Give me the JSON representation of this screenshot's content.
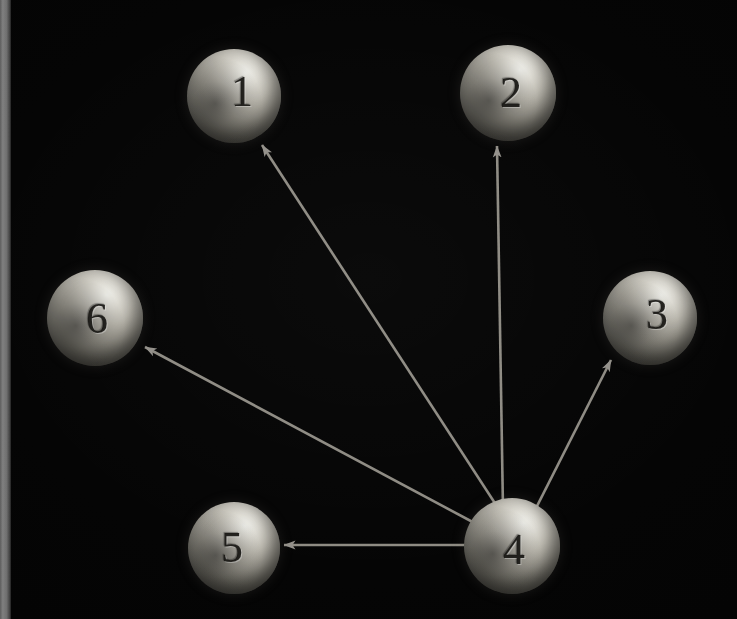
{
  "figure": {
    "kind": "directed-graph-diagram",
    "width": 737,
    "height": 619,
    "background_color": "#020202",
    "node_fill_color": "#c9c6bc",
    "edge_color": "#8d8a82",
    "label_color": "#181714",
    "left_strip_color": "#7e7e7e"
  },
  "nodes": [
    {
      "id": "1",
      "label": "1",
      "cx": 234,
      "cy": 96,
      "r": 47
    },
    {
      "id": "2",
      "label": "2",
      "cx": 508,
      "cy": 93,
      "r": 48
    },
    {
      "id": "3",
      "label": "3",
      "cx": 650,
      "cy": 318,
      "r": 47
    },
    {
      "id": "4",
      "label": "4",
      "cx": 512,
      "cy": 546,
      "r": 48
    },
    {
      "id": "5",
      "label": "5",
      "cx": 234,
      "cy": 548,
      "r": 46
    },
    {
      "id": "6",
      "label": "6",
      "cx": 95,
      "cy": 318,
      "r": 48
    }
  ],
  "edges": [
    {
      "from": "4",
      "to": "1",
      "directed": true,
      "x1": 500,
      "y1": 511,
      "x2": 262,
      "y2": 145
    },
    {
      "from": "4",
      "to": "2",
      "directed": true,
      "x1": 503,
      "y1": 510,
      "x2": 497,
      "y2": 146
    },
    {
      "from": "4",
      "to": "3",
      "directed": true,
      "x1": 533,
      "y1": 514,
      "x2": 611,
      "y2": 360
    },
    {
      "from": "4",
      "to": "5",
      "directed": true,
      "x1": 470,
      "y1": 545,
      "x2": 284,
      "y2": 545
    },
    {
      "from": "4",
      "to": "6",
      "directed": true,
      "x1": 482,
      "y1": 527,
      "x2": 145,
      "y2": 347
    }
  ]
}
